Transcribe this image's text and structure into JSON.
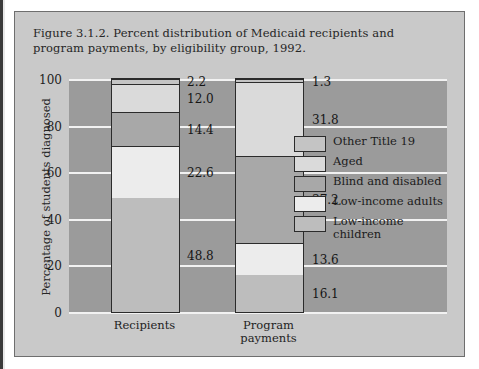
{
  "figure": {
    "title": "Figure 3.1.2. Percent distribution of Medicaid recipients and program payments, by eligibility group, 1992.",
    "panel_bg": "#c9c9c9",
    "plot_bg": "#9b9b9b",
    "gridline_color": "#f2f2f2",
    "border_color": "#6e6e6e"
  },
  "chart_data": {
    "type": "bar",
    "subtype": "stacked-bar-100",
    "title": "Figure 3.1.2. Percent distribution of Medicaid recipients and program payments, by eligibility group, 1992.",
    "xlabel": "",
    "ylabel": "Percentage of students diagnosed",
    "ylim": [
      0,
      100
    ],
    "yticks": [
      0,
      20,
      40,
      60,
      80,
      100
    ],
    "grid": true,
    "legend_position": "center-right",
    "categories": [
      "Recipients",
      "Program\npayments"
    ],
    "series": [
      {
        "name": "Low-income children",
        "values": [
          48.8,
          16.1
        ],
        "color": "#bdbdbd"
      },
      {
        "name": "Low-income adults",
        "values": [
          22.6,
          13.6
        ],
        "color": "#ececec"
      },
      {
        "name": "Blind and disabled",
        "values": [
          14.4,
          37.2
        ],
        "color": "#a8a8a8"
      },
      {
        "name": "Aged",
        "values": [
          12.0,
          31.8
        ],
        "color": "#dadada"
      },
      {
        "name": "Other Title 19",
        "values": [
          2.2,
          1.3
        ],
        "color": "#c4c4c4"
      }
    ],
    "data_labels": {
      "Recipients": [
        "48.8",
        "22.6",
        "14.4",
        "12.0",
        "2.2"
      ],
      "Program payments": [
        "16.1",
        "13.6",
        "37.2",
        "31.8",
        "1.3"
      ]
    }
  },
  "legend": {
    "items": [
      {
        "label": "Other Title 19"
      },
      {
        "label": "Aged"
      },
      {
        "label": "Blind and disabled"
      },
      {
        "label": "Low-income adults"
      },
      {
        "label": "Low-income\nchildren"
      }
    ]
  }
}
